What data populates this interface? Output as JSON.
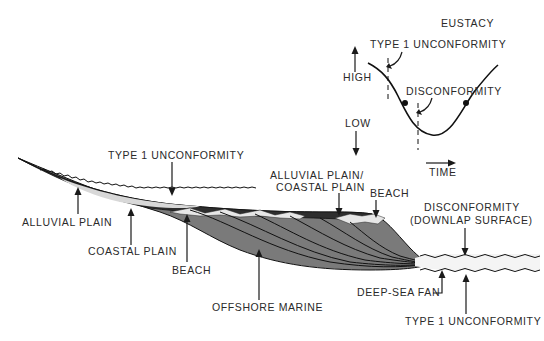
{
  "diagram": {
    "type": "geologic-cross-section",
    "colors": {
      "marine_fill": "#7a7a7a",
      "dark_fill": "#2e2e2e",
      "light_band": "#e4e4e4",
      "line": "#111111",
      "text": "#2a2a2a"
    },
    "labels": {
      "type1_unconformity_top": "TYPE 1 UNCONFORMITY",
      "alluvial_plain": "ALLUVIAL PLAIN",
      "coastal_plain": "COASTAL PLAIN",
      "beach_left": "BEACH",
      "offshore_marine": "OFFSHORE MARINE",
      "alluvial_coastal_plain_line1": "ALLUVIAL PLAIN/",
      "alluvial_coastal_plain_line2": "COASTAL PLAIN",
      "beach_right": "BEACH",
      "disconformity_line1": "DISCONFORMITY",
      "disconformity_line2": "(DOWNLAP SURFACE)",
      "deep_sea_fan": "DEEP-SEA FAN",
      "type1_unconformity_bottom": "TYPE 1 UNCONFORMITY"
    }
  },
  "eustacy_inset": {
    "title": "EUSTACY",
    "high_label": "HIGH",
    "low_label": "LOW",
    "time_label": "TIME",
    "type1_unconformity_label": "TYPE 1 UNCONFORMITY",
    "disconformity_label": "DISCONFORMITY",
    "curve": "sine, high at left, trough near center-right, rising to right"
  }
}
